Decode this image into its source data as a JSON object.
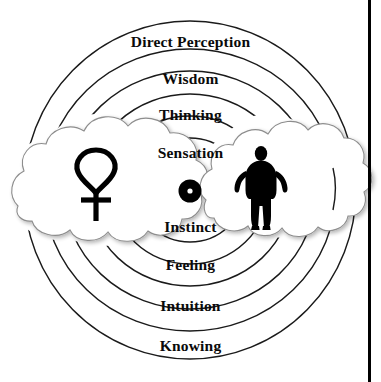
{
  "diagram": {
    "type": "concentric-rings",
    "center_symbol_name": "point-within-circle",
    "rings": [
      {
        "index": 0,
        "label": "Direct Perception"
      },
      {
        "index": 1,
        "label": "Wisdom"
      },
      {
        "index": 2,
        "label": "Thinking"
      },
      {
        "index": 3,
        "label": "Sensation"
      },
      {
        "index": 4,
        "label": "Instinct"
      },
      {
        "index": 5,
        "label": "Feeling"
      },
      {
        "index": 6,
        "label": "Intuition"
      },
      {
        "index": 7,
        "label": "Knowing"
      }
    ],
    "figures": [
      {
        "name": "ankh-symbol",
        "side": "left"
      },
      {
        "name": "human-silhouette",
        "side": "right"
      }
    ],
    "clouds": [
      {
        "name": "cloud-left",
        "side": "left"
      },
      {
        "name": "cloud-right",
        "side": "right"
      }
    ],
    "colors": {
      "ink": "#0a0a0a",
      "line": "#1a1a1a",
      "cloud_outline": "#8d8d8d",
      "cloud_fill": "#ffffff",
      "background": "#ffffff"
    }
  }
}
